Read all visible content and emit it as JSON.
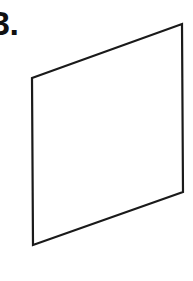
{
  "page": {
    "background_color": "#ffffff",
    "width": 193,
    "height": 281
  },
  "figure": {
    "label": "3.",
    "label_color": "#111111",
    "type": "line-art-geometry",
    "shape_name": "parallelogram",
    "stroke_color": "#1a1a1a",
    "stroke_width": 2.2,
    "fill_color": "#ffffff",
    "vertices": {
      "top_left": [
        32,
        78
      ],
      "top_right": [
        182,
        24
      ],
      "bottom_right": [
        183,
        192
      ],
      "bottom_left": [
        33,
        245
      ]
    },
    "points_attr": "32,78 182,24 183,192 33,245"
  }
}
